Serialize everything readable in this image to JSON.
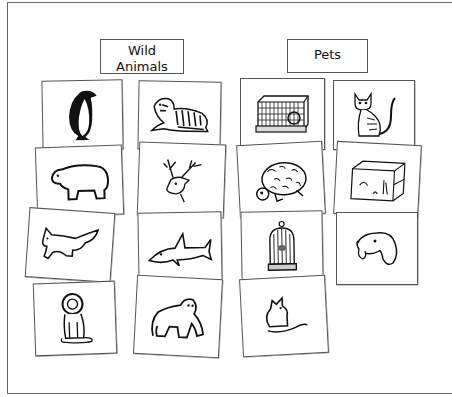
{
  "worksheet": {
    "categories": [
      {
        "id": "wild",
        "label_line1": "Wild",
        "label_line2": "Animals"
      },
      {
        "id": "pets",
        "label_line1": "Pets",
        "label_line2": ""
      }
    ],
    "cards": [
      {
        "name": "penguin",
        "category": "wild"
      },
      {
        "name": "tiger",
        "category": "wild"
      },
      {
        "name": "hamster-cage",
        "category": "pets"
      },
      {
        "name": "cat",
        "category": "pets"
      },
      {
        "name": "polar-bear",
        "category": "wild"
      },
      {
        "name": "deer",
        "category": "wild"
      },
      {
        "name": "turtle",
        "category": "pets"
      },
      {
        "name": "aquarium",
        "category": "pets"
      },
      {
        "name": "fox",
        "category": "wild"
      },
      {
        "name": "shark",
        "category": "wild"
      },
      {
        "name": "birdcage",
        "category": "pets"
      },
      {
        "name": "dog",
        "category": "pets"
      },
      {
        "name": "lion",
        "category": "wild"
      },
      {
        "name": "gorilla",
        "category": "wild"
      },
      {
        "name": "mouse",
        "category": "pets"
      }
    ]
  }
}
